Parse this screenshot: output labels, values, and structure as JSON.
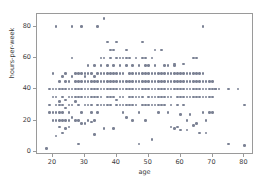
{
  "chart_data": {
    "type": "scatter",
    "title": "",
    "xlabel": "age",
    "ylabel": "hours-per-week",
    "xlim": [
      15,
      83
    ],
    "ylim": [
      -2,
      88
    ],
    "xticks": [
      20,
      30,
      40,
      50,
      60,
      70,
      80
    ],
    "yticks": [
      0,
      20,
      40,
      60,
      80
    ],
    "grid": false,
    "legend": null,
    "marker": {
      "shape": "circle",
      "color": "#7b8294",
      "size": 2.6
    },
    "points": [
      [
        18,
        2
      ],
      [
        19,
        25
      ],
      [
        19,
        40
      ],
      [
        19,
        30
      ],
      [
        20,
        20
      ],
      [
        20,
        40
      ],
      [
        20,
        25
      ],
      [
        20,
        50
      ],
      [
        20,
        35
      ],
      [
        21,
        10
      ],
      [
        21,
        20
      ],
      [
        21,
        35
      ],
      [
        21,
        40
      ],
      [
        21,
        80
      ],
      [
        21,
        30
      ],
      [
        21,
        25
      ],
      [
        22,
        16
      ],
      [
        22,
        20
      ],
      [
        22,
        40
      ],
      [
        22,
        32
      ],
      [
        22,
        45
      ],
      [
        22,
        30
      ],
      [
        22,
        25
      ],
      [
        23,
        12
      ],
      [
        23,
        20
      ],
      [
        23,
        40
      ],
      [
        23,
        35
      ],
      [
        23,
        48
      ],
      [
        23,
        30
      ],
      [
        23,
        25
      ],
      [
        24,
        15
      ],
      [
        24,
        40
      ],
      [
        24,
        33
      ],
      [
        24,
        45
      ],
      [
        24,
        20
      ],
      [
        24,
        28
      ],
      [
        24,
        50
      ],
      [
        25,
        16
      ],
      [
        25,
        40
      ],
      [
        25,
        30
      ],
      [
        25,
        35
      ],
      [
        25,
        25
      ],
      [
        25,
        45
      ],
      [
        25,
        20
      ],
      [
        26,
        40
      ],
      [
        26,
        35
      ],
      [
        26,
        48
      ],
      [
        26,
        60
      ],
      [
        26,
        80
      ],
      [
        26,
        30
      ],
      [
        26,
        22
      ],
      [
        27,
        40
      ],
      [
        27,
        45
      ],
      [
        27,
        32
      ],
      [
        27,
        20
      ],
      [
        27,
        50
      ],
      [
        27,
        35
      ],
      [
        28,
        5
      ],
      [
        28,
        40
      ],
      [
        28,
        45
      ],
      [
        28,
        30
      ],
      [
        28,
        50
      ],
      [
        28,
        20
      ],
      [
        28,
        35
      ],
      [
        29,
        40
      ],
      [
        29,
        45
      ],
      [
        29,
        80
      ],
      [
        29,
        35
      ],
      [
        29,
        18
      ],
      [
        29,
        50
      ],
      [
        29,
        25
      ],
      [
        30,
        40
      ],
      [
        30,
        45
      ],
      [
        30,
        48
      ],
      [
        30,
        30
      ],
      [
        30,
        18
      ],
      [
        30,
        50
      ],
      [
        30,
        35
      ],
      [
        31,
        40
      ],
      [
        31,
        45
      ],
      [
        31,
        20
      ],
      [
        31,
        30
      ],
      [
        31,
        50
      ],
      [
        31,
        35
      ],
      [
        31,
        55
      ],
      [
        32,
        40
      ],
      [
        32,
        45
      ],
      [
        32,
        50
      ],
      [
        32,
        35
      ],
      [
        32,
        19
      ],
      [
        32,
        25
      ],
      [
        32,
        30
      ],
      [
        33,
        40
      ],
      [
        33,
        45
      ],
      [
        33,
        48
      ],
      [
        33,
        20
      ],
      [
        33,
        55
      ],
      [
        33,
        35
      ],
      [
        33,
        11
      ],
      [
        34,
        40
      ],
      [
        34,
        45
      ],
      [
        34,
        50
      ],
      [
        34,
        30
      ],
      [
        34,
        80
      ],
      [
        34,
        35
      ],
      [
        34,
        25
      ],
      [
        35,
        40
      ],
      [
        35,
        45
      ],
      [
        35,
        55
      ],
      [
        35,
        60
      ],
      [
        35,
        30
      ],
      [
        35,
        50
      ],
      [
        35,
        35
      ],
      [
        36,
        40
      ],
      [
        36,
        45
      ],
      [
        36,
        50
      ],
      [
        36,
        85
      ],
      [
        36,
        60
      ],
      [
        36,
        30
      ],
      [
        36,
        15
      ],
      [
        37,
        40
      ],
      [
        37,
        45
      ],
      [
        37,
        55
      ],
      [
        37,
        70
      ],
      [
        37,
        35
      ],
      [
        37,
        50
      ],
      [
        37,
        30
      ],
      [
        38,
        40
      ],
      [
        38,
        45
      ],
      [
        38,
        60
      ],
      [
        38,
        65
      ],
      [
        38,
        30
      ],
      [
        38,
        50
      ],
      [
        38,
        35
      ],
      [
        39,
        40
      ],
      [
        39,
        45
      ],
      [
        39,
        55
      ],
      [
        39,
        65
      ],
      [
        39,
        35
      ],
      [
        39,
        50
      ],
      [
        39,
        15
      ],
      [
        40,
        40
      ],
      [
        40,
        45
      ],
      [
        40,
        50
      ],
      [
        40,
        70
      ],
      [
        40,
        60
      ],
      [
        40,
        30
      ],
      [
        40,
        33
      ],
      [
        41,
        40
      ],
      [
        41,
        45
      ],
      [
        41,
        55
      ],
      [
        41,
        60
      ],
      [
        41,
        35
      ],
      [
        41,
        50
      ],
      [
        41,
        30
      ],
      [
        42,
        40
      ],
      [
        42,
        45
      ],
      [
        42,
        50
      ],
      [
        42,
        60
      ],
      [
        42,
        30
      ],
      [
        42,
        35
      ],
      [
        42,
        25
      ],
      [
        43,
        40
      ],
      [
        43,
        45
      ],
      [
        43,
        55
      ],
      [
        43,
        60
      ],
      [
        43,
        65
      ],
      [
        43,
        30
      ],
      [
        43,
        22
      ],
      [
        44,
        40
      ],
      [
        44,
        45
      ],
      [
        44,
        50
      ],
      [
        44,
        60
      ],
      [
        44,
        35
      ],
      [
        44,
        30
      ],
      [
        45,
        40
      ],
      [
        45,
        45
      ],
      [
        45,
        55
      ],
      [
        45,
        50
      ],
      [
        45,
        30
      ],
      [
        45,
        35
      ],
      [
        45,
        20
      ],
      [
        46,
        40
      ],
      [
        46,
        45
      ],
      [
        46,
        50
      ],
      [
        46,
        60
      ],
      [
        46,
        35
      ],
      [
        46,
        30
      ],
      [
        47,
        5
      ],
      [
        47,
        40
      ],
      [
        47,
        45
      ],
      [
        47,
        55
      ],
      [
        47,
        25
      ],
      [
        47,
        50
      ],
      [
        47,
        35
      ],
      [
        48,
        40
      ],
      [
        48,
        45
      ],
      [
        48,
        70
      ],
      [
        48,
        60
      ],
      [
        48,
        50
      ],
      [
        48,
        30
      ],
      [
        48,
        35
      ],
      [
        49,
        40
      ],
      [
        49,
        45
      ],
      [
        49,
        55
      ],
      [
        49,
        50
      ],
      [
        49,
        60
      ],
      [
        49,
        30
      ],
      [
        49,
        20
      ],
      [
        50,
        40
      ],
      [
        50,
        45
      ],
      [
        50,
        50
      ],
      [
        50,
        35
      ],
      [
        50,
        30
      ],
      [
        50,
        55
      ],
      [
        51,
        40
      ],
      [
        51,
        45
      ],
      [
        51,
        50
      ],
      [
        51,
        8
      ],
      [
        51,
        35
      ],
      [
        51,
        60
      ],
      [
        51,
        30
      ],
      [
        52,
        40
      ],
      [
        52,
        45
      ],
      [
        52,
        55
      ],
      [
        52,
        50
      ],
      [
        52,
        35
      ],
      [
        52,
        30
      ],
      [
        52,
        65
      ],
      [
        53,
        40
      ],
      [
        53,
        45
      ],
      [
        53,
        50
      ],
      [
        53,
        30
      ],
      [
        53,
        35
      ],
      [
        53,
        25
      ],
      [
        54,
        40
      ],
      [
        54,
        45
      ],
      [
        54,
        65
      ],
      [
        54,
        50
      ],
      [
        54,
        35
      ],
      [
        54,
        30
      ],
      [
        55,
        40
      ],
      [
        55,
        45
      ],
      [
        55,
        50
      ],
      [
        55,
        55
      ],
      [
        55,
        35
      ],
      [
        55,
        30
      ],
      [
        56,
        40
      ],
      [
        56,
        45
      ],
      [
        56,
        55
      ],
      [
        56,
        25
      ],
      [
        56,
        50
      ],
      [
        56,
        35
      ],
      [
        57,
        40
      ],
      [
        57,
        45
      ],
      [
        57,
        16
      ],
      [
        57,
        50
      ],
      [
        57,
        35
      ],
      [
        57,
        30
      ],
      [
        58,
        40
      ],
      [
        58,
        45
      ],
      [
        58,
        55
      ],
      [
        58,
        56
      ],
      [
        58,
        15
      ],
      [
        58,
        50
      ],
      [
        59,
        40
      ],
      [
        59,
        45
      ],
      [
        59,
        50
      ],
      [
        59,
        35
      ],
      [
        59,
        16
      ],
      [
        59,
        30
      ],
      [
        60,
        40
      ],
      [
        60,
        45
      ],
      [
        60,
        50
      ],
      [
        60,
        24
      ],
      [
        60,
        35
      ],
      [
        60,
        14
      ],
      [
        61,
        40
      ],
      [
        61,
        45
      ],
      [
        61,
        56
      ],
      [
        61,
        50
      ],
      [
        61,
        35
      ],
      [
        61,
        30
      ],
      [
        62,
        40
      ],
      [
        62,
        45
      ],
      [
        62,
        20
      ],
      [
        62,
        50
      ],
      [
        62,
        35
      ],
      [
        62,
        14
      ],
      [
        63,
        40
      ],
      [
        63,
        45
      ],
      [
        63,
        50
      ],
      [
        63,
        35
      ],
      [
        63,
        24
      ],
      [
        64,
        40
      ],
      [
        64,
        45
      ],
      [
        64,
        50
      ],
      [
        64,
        60
      ],
      [
        64,
        35
      ],
      [
        64,
        17
      ],
      [
        65,
        40
      ],
      [
        65,
        45
      ],
      [
        65,
        60
      ],
      [
        65,
        50
      ],
      [
        65,
        35
      ],
      [
        65,
        18
      ],
      [
        66,
        40
      ],
      [
        66,
        45
      ],
      [
        66,
        50
      ],
      [
        66,
        35
      ],
      [
        66,
        12
      ],
      [
        67,
        40
      ],
      [
        67,
        45
      ],
      [
        67,
        80
      ],
      [
        67,
        50
      ],
      [
        67,
        35
      ],
      [
        67,
        25
      ],
      [
        68,
        40
      ],
      [
        68,
        45
      ],
      [
        68,
        35
      ],
      [
        68,
        20
      ],
      [
        68,
        12
      ],
      [
        69,
        40
      ],
      [
        69,
        45
      ],
      [
        69,
        35
      ],
      [
        69,
        25
      ],
      [
        70,
        40
      ],
      [
        70,
        45
      ],
      [
        70,
        35
      ],
      [
        70,
        25
      ],
      [
        71,
        40
      ],
      [
        71,
        40
      ],
      [
        72,
        40
      ],
      [
        75,
        5
      ],
      [
        75,
        40
      ],
      [
        78,
        40
      ],
      [
        80,
        4
      ],
      [
        80,
        30
      ]
    ]
  }
}
